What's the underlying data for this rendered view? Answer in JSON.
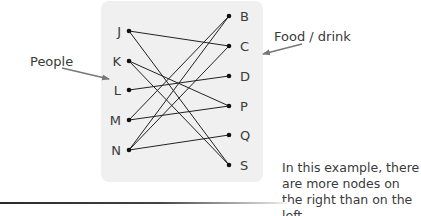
{
  "diagram": {
    "type": "bipartite-graph",
    "box": {
      "x": 101,
      "y": 1,
      "w": 162,
      "h": 181,
      "fill": "#f0f0f0"
    },
    "left_nodes": [
      {
        "id": "J",
        "label": "J",
        "x": 129,
        "y": 31
      },
      {
        "id": "K",
        "label": "K",
        "x": 129,
        "y": 61
      },
      {
        "id": "L",
        "label": "L",
        "x": 129,
        "y": 90
      },
      {
        "id": "M",
        "label": "M",
        "x": 129,
        "y": 120
      },
      {
        "id": "N",
        "label": "N",
        "x": 129,
        "y": 150
      }
    ],
    "right_nodes": [
      {
        "id": "B",
        "label": "B",
        "x": 229,
        "y": 16
      },
      {
        "id": "C",
        "label": "C",
        "x": 229,
        "y": 46
      },
      {
        "id": "D",
        "label": "D",
        "x": 229,
        "y": 76
      },
      {
        "id": "P",
        "label": "P",
        "x": 229,
        "y": 106
      },
      {
        "id": "Q",
        "label": "Q",
        "x": 229,
        "y": 135
      },
      {
        "id": "S",
        "label": "S",
        "x": 229,
        "y": 165
      }
    ],
    "edges": [
      [
        "J",
        "C"
      ],
      [
        "J",
        "S"
      ],
      [
        "K",
        "P"
      ],
      [
        "K",
        "S"
      ],
      [
        "L",
        "D"
      ],
      [
        "M",
        "B"
      ],
      [
        "M",
        "P"
      ],
      [
        "N",
        "B"
      ],
      [
        "N",
        "C"
      ],
      [
        "N",
        "Q"
      ]
    ],
    "annotations": {
      "left_label": "People",
      "right_label": "Food / drink",
      "note": "In this example, there are more nodes on the right than on the left."
    }
  }
}
